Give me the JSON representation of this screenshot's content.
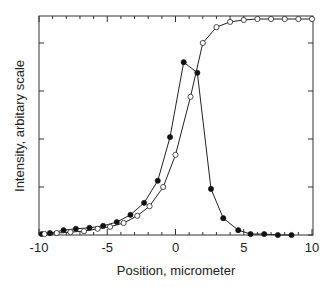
{
  "chart_data": {
    "type": "line",
    "title": "",
    "xlabel": "Position, micrometer",
    "ylabel": "Intensity, arbitary scale",
    "xlim": [
      -10,
      10
    ],
    "ylim": [
      0,
      4.55
    ],
    "xticks": [
      -10,
      -5,
      0,
      5,
      10
    ],
    "xtick_labels": [
      "-10",
      "-5",
      "0",
      "5",
      "10"
    ],
    "yticks": [
      0,
      1,
      2,
      3,
      4
    ],
    "ytick_labels": [],
    "grid": false,
    "legend": null,
    "series": [
      {
        "name": "filled-circles",
        "marker": "filled-circle",
        "x": [
          -9.8,
          -9.2,
          -8.2,
          -7.3,
          -6.3,
          -5.3,
          -4.3,
          -3.3,
          -2.3,
          -1.3,
          -0.4,
          0.6,
          1.6,
          2.6,
          3.5,
          4.6,
          5.5,
          6.5,
          7.5,
          8.5
        ],
        "y": [
          0.02,
          0.04,
          0.1,
          0.13,
          0.15,
          0.19,
          0.27,
          0.42,
          0.67,
          1.13,
          2.04,
          3.6,
          3.38,
          0.96,
          0.35,
          0.1,
          0.02,
          0.02,
          0.0,
          0.0
        ]
      },
      {
        "name": "open-circles",
        "marker": "open-circle",
        "x": [
          -9.6,
          -8.7,
          -7.7,
          -6.7,
          -5.7,
          -4.8,
          -3.8,
          -2.8,
          -1.9,
          -0.9,
          0.0,
          1.1,
          2.0,
          3.0,
          4.0,
          5.0,
          6.0,
          7.0,
          8.0,
          9.0,
          10.0
        ],
        "y": [
          0.02,
          0.04,
          0.06,
          0.08,
          0.13,
          0.17,
          0.25,
          0.4,
          0.6,
          1.0,
          1.67,
          2.88,
          4.0,
          4.33,
          4.44,
          4.48,
          4.5,
          4.5,
          4.5,
          4.5,
          4.5
        ]
      }
    ]
  }
}
